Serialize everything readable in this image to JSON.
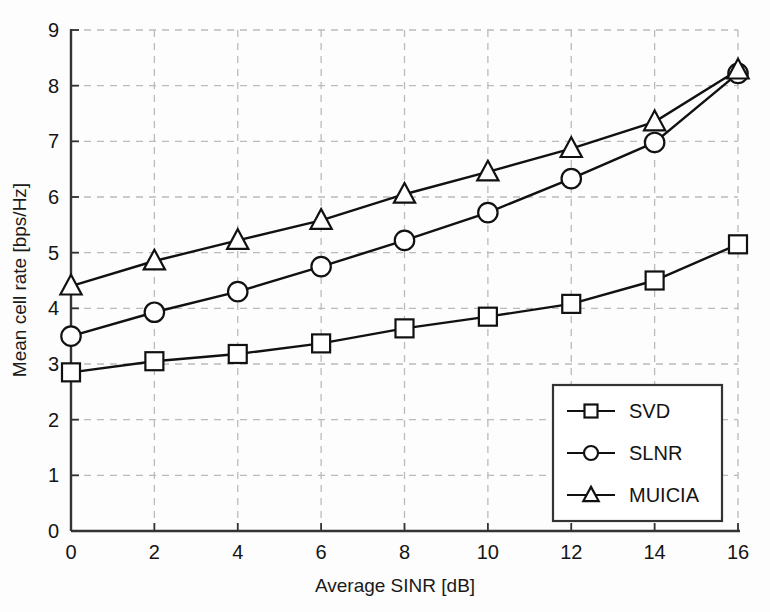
{
  "chart_data": {
    "type": "line",
    "title": "",
    "xlabel": "Average SINR [dB]",
    "ylabel": "Mean cell rate [bps/Hz]",
    "x": [
      0,
      2,
      4,
      6,
      8,
      10,
      12,
      14,
      16
    ],
    "xticklabels": [
      "0",
      "2",
      "4",
      "6",
      "8",
      "10",
      "12",
      "14",
      "16"
    ],
    "yticklabels": [
      "0",
      "1",
      "2",
      "3",
      "4",
      "5",
      "6",
      "7",
      "8",
      "9"
    ],
    "xlim": [
      0,
      16
    ],
    "ylim": [
      0,
      9
    ],
    "grid": true,
    "grid_style": "dashed",
    "legend_position": "lower right",
    "series": [
      {
        "name": "SVD",
        "marker": "square",
        "values": [
          2.85,
          3.05,
          3.18,
          3.37,
          3.64,
          3.85,
          4.08,
          4.5,
          5.15
        ]
      },
      {
        "name": "SLNR",
        "marker": "circle",
        "values": [
          3.5,
          3.93,
          4.3,
          4.75,
          5.22,
          5.72,
          6.33,
          6.98,
          8.22
        ]
      },
      {
        "name": "MUICIA",
        "marker": "triangle",
        "values": [
          4.4,
          4.85,
          5.22,
          5.58,
          6.05,
          6.45,
          6.87,
          7.35,
          8.28
        ]
      }
    ]
  },
  "colors": {
    "line": "#111111",
    "axis": "#333333",
    "grid": "#bbbbbb",
    "background": "#fdfdfd",
    "text": "#141414"
  },
  "legend": {
    "items": [
      {
        "label": "SVD"
      },
      {
        "label": "SLNR"
      },
      {
        "label": "MUICIA"
      }
    ]
  }
}
